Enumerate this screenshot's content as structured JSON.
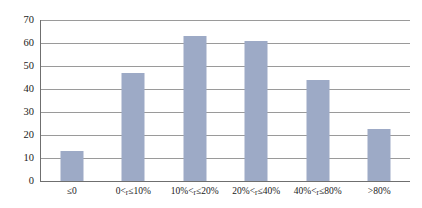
{
  "chart_data": {
    "type": "bar",
    "title": "",
    "subtitle": "",
    "xlabel": "",
    "ylabel": "",
    "categories": [
      "≤0",
      "0<r≤10%",
      "10%<r≤20%",
      "20%<r≤40%",
      "40%<r≤80%",
      ">80%"
    ],
    "category_parts": [
      {
        "pre": "≤0",
        "var": "",
        "post": ""
      },
      {
        "pre": "0<",
        "var": "r",
        "post": "≤10%"
      },
      {
        "pre": "10%<",
        "var": "r",
        "post": "≤20%"
      },
      {
        "pre": "20%<",
        "var": "r",
        "post": "≤40%"
      },
      {
        "pre": "40%<",
        "var": "r",
        "post": "≤80%"
      },
      {
        "pre": ">80%",
        "var": "",
        "post": ""
      }
    ],
    "values": [
      13,
      47,
      63,
      61,
      44,
      22.5
    ],
    "ylim": [
      0,
      70
    ],
    "yticks": [
      0,
      10,
      20,
      30,
      40,
      50,
      60,
      70
    ],
    "ytick_labels": [
      "0",
      "10",
      "20",
      "30",
      "40",
      "50",
      "60",
      "70"
    ],
    "grid": "horizontal",
    "legend": "none",
    "bar_color": "#9daac6",
    "gridline_color": "#9a9a9a",
    "axis_color": "#6f6f6f",
    "background_color": "#ffffff"
  }
}
